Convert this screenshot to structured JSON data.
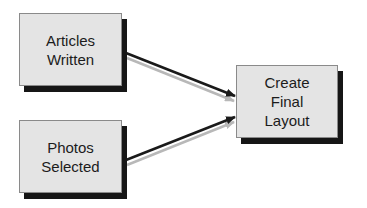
{
  "diagram": {
    "nodes": [
      {
        "id": "articles-written",
        "label": "Articles\nWritten"
      },
      {
        "id": "photos-selected",
        "label": "Photos\nSelected"
      },
      {
        "id": "create-final-layout",
        "label": "Create\nFinal\nLayout"
      }
    ],
    "edges": [
      {
        "from": "articles-written",
        "to": "create-final-layout"
      },
      {
        "from": "photos-selected",
        "to": "create-final-layout"
      }
    ],
    "colors": {
      "node_fill": "#e4e4e4",
      "node_border": "#8a8a8a",
      "node_shadow": "#161616",
      "arrow": "#1a1a1a",
      "arrow_shadow": "#b8b8b8",
      "text": "#1c1c1c"
    }
  }
}
